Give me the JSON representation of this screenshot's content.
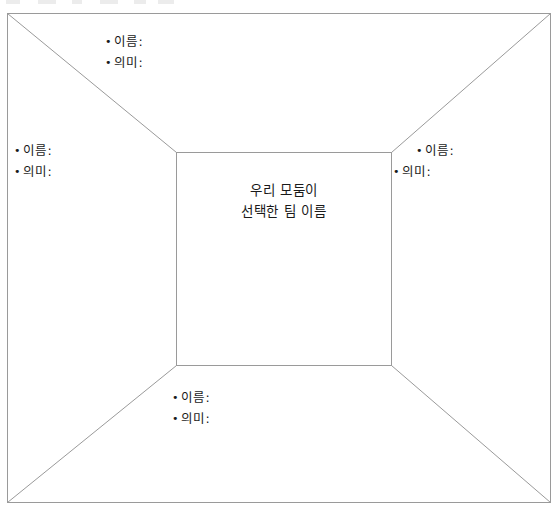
{
  "page": {
    "width": 559,
    "height": 514,
    "background_color": "#ffffff",
    "line_color": "#9a9a9a",
    "text_color": "#1a1a1a"
  },
  "diagram": {
    "type": "one-point-perspective-frame",
    "outer_rect": {
      "left": 7,
      "top": 13,
      "right": 551,
      "bottom": 503
    },
    "inner_rect": {
      "left": 176,
      "top": 152,
      "right": 392,
      "bottom": 366
    },
    "diagonals": [
      {
        "name": "top-left-diagonal",
        "from": [
          7,
          13
        ],
        "to": [
          176,
          152
        ]
      },
      {
        "name": "top-right-diagonal",
        "from": [
          551,
          13
        ],
        "to": [
          392,
          152
        ]
      },
      {
        "name": "bottom-left-diagonal",
        "from": [
          7,
          503
        ],
        "to": [
          176,
          366
        ]
      },
      {
        "name": "bottom-right-diagonal",
        "from": [
          551,
          503
        ],
        "to": [
          392,
          366
        ]
      }
    ]
  },
  "center": {
    "line1": "우리 모둠이",
    "line2": "선택한 팀 이름"
  },
  "bullet_marker": "•",
  "panels": {
    "top": {
      "name_label": "이름:",
      "meaning_label": "의미:"
    },
    "left": {
      "name_label": "이름:",
      "meaning_label": "의미:"
    },
    "right": {
      "name_label": "이름:",
      "meaning_label": "의미:"
    },
    "bottom": {
      "name_label": "이름:",
      "meaning_label": "의미:"
    }
  }
}
